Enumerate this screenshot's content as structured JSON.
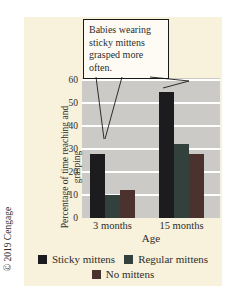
{
  "figure": {
    "copyright": "© 2019 Cengage",
    "annotation": "Babies wearing sticky mittens grasped more often."
  },
  "chart_data": {
    "type": "bar",
    "title": "",
    "xlabel": "Age",
    "ylabel": "Percentage of time reaching and grasping",
    "categories": [
      "3 months",
      "15 months"
    ],
    "series": [
      {
        "name": "Sticky mittens",
        "color": "#1c1c1e",
        "values": [
          28,
          55
        ]
      },
      {
        "name": "Regular mittens",
        "color": "#33413d",
        "values": [
          10,
          32
        ]
      },
      {
        "name": "No mittens",
        "color": "#4c322e",
        "values": [
          12,
          28
        ]
      }
    ],
    "ylim": [
      0,
      60
    ],
    "yticks": [
      0,
      10,
      20,
      30,
      40,
      50,
      60
    ],
    "grid": true,
    "legend_position": "bottom",
    "colors": {
      "panel_bg": "#f8f1db",
      "plot_bg": "#cbcac6",
      "gridline": "#ffffff",
      "text": "#2e2d2b"
    }
  }
}
